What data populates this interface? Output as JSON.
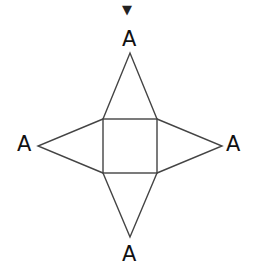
{
  "diagram": {
    "type": "net-of-square-pyramid",
    "marker": {
      "glyph": "▼",
      "name": "down-triangle-marker"
    },
    "labels": {
      "top": "A",
      "left": "A",
      "right": "A",
      "bottom": "A"
    },
    "stroke_color": "#444444",
    "square": {
      "x1": 103,
      "y1": 119,
      "x2": 157,
      "y2": 173
    },
    "apexes": {
      "top": [
        130,
        53
      ],
      "left": [
        38,
        146
      ],
      "right": [
        222,
        146
      ],
      "bottom": [
        130,
        237
      ]
    }
  }
}
